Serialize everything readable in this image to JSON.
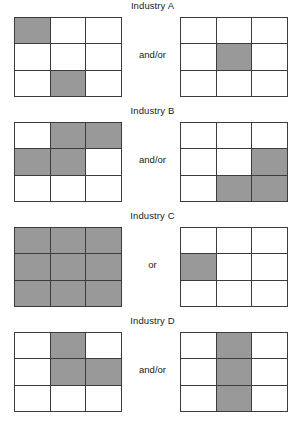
{
  "figure": {
    "cell_colors": {
      "shaded": "#999999",
      "empty": "#ffffff",
      "grid_line": "#3c3c3c"
    },
    "grid_rows": 3,
    "grid_cols": 3,
    "blocks": [
      {
        "title": "Industry A",
        "connector": "and/or",
        "left_grid": [
          [
            1,
            0,
            0
          ],
          [
            0,
            0,
            0
          ],
          [
            0,
            1,
            0
          ]
        ],
        "right_grid": [
          [
            0,
            0,
            0
          ],
          [
            0,
            1,
            0
          ],
          [
            0,
            0,
            0
          ]
        ]
      },
      {
        "title": "Industry B",
        "connector": "and/or",
        "left_grid": [
          [
            0,
            1,
            1
          ],
          [
            1,
            1,
            0
          ],
          [
            0,
            0,
            0
          ]
        ],
        "right_grid": [
          [
            0,
            0,
            0
          ],
          [
            0,
            0,
            1
          ],
          [
            0,
            1,
            1
          ]
        ]
      },
      {
        "title": "Industry C",
        "connector": "or",
        "left_grid": [
          [
            1,
            1,
            1
          ],
          [
            1,
            1,
            1
          ],
          [
            1,
            1,
            1
          ]
        ],
        "right_grid": [
          [
            0,
            0,
            0
          ],
          [
            1,
            0,
            0
          ],
          [
            0,
            0,
            0
          ]
        ]
      },
      {
        "title": "Industry D",
        "connector": "and/or",
        "left_grid": [
          [
            0,
            1,
            0
          ],
          [
            0,
            1,
            1
          ],
          [
            0,
            0,
            0
          ]
        ],
        "right_grid": [
          [
            0,
            1,
            0
          ],
          [
            0,
            1,
            0
          ],
          [
            0,
            1,
            0
          ]
        ]
      }
    ]
  }
}
